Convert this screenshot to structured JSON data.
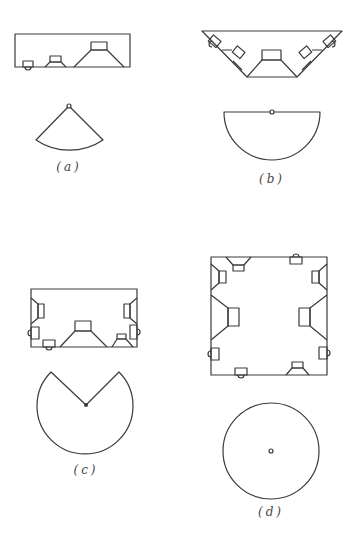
{
  "figure": {
    "panels": [
      {
        "id": "a",
        "label": "(a)",
        "enclosure": "rectangular box, front-facing drivers",
        "pattern": "fan-shaped wedge (~90°)"
      },
      {
        "id": "b",
        "label": "(b)",
        "enclosure": "trapezoidal box with angled side drivers",
        "pattern": "semicircle (180°)"
      },
      {
        "id": "c",
        "label": "(c)",
        "enclosure": "rectangular box with side drivers",
        "pattern": "circle with wedge notch (~270°)"
      },
      {
        "id": "d",
        "label": "(d)",
        "enclosure": "square box, drivers on all sides",
        "pattern": "full circle (360°)"
      }
    ]
  },
  "colors": {
    "line": "#3a3a3a",
    "background": "#ffffff"
  }
}
